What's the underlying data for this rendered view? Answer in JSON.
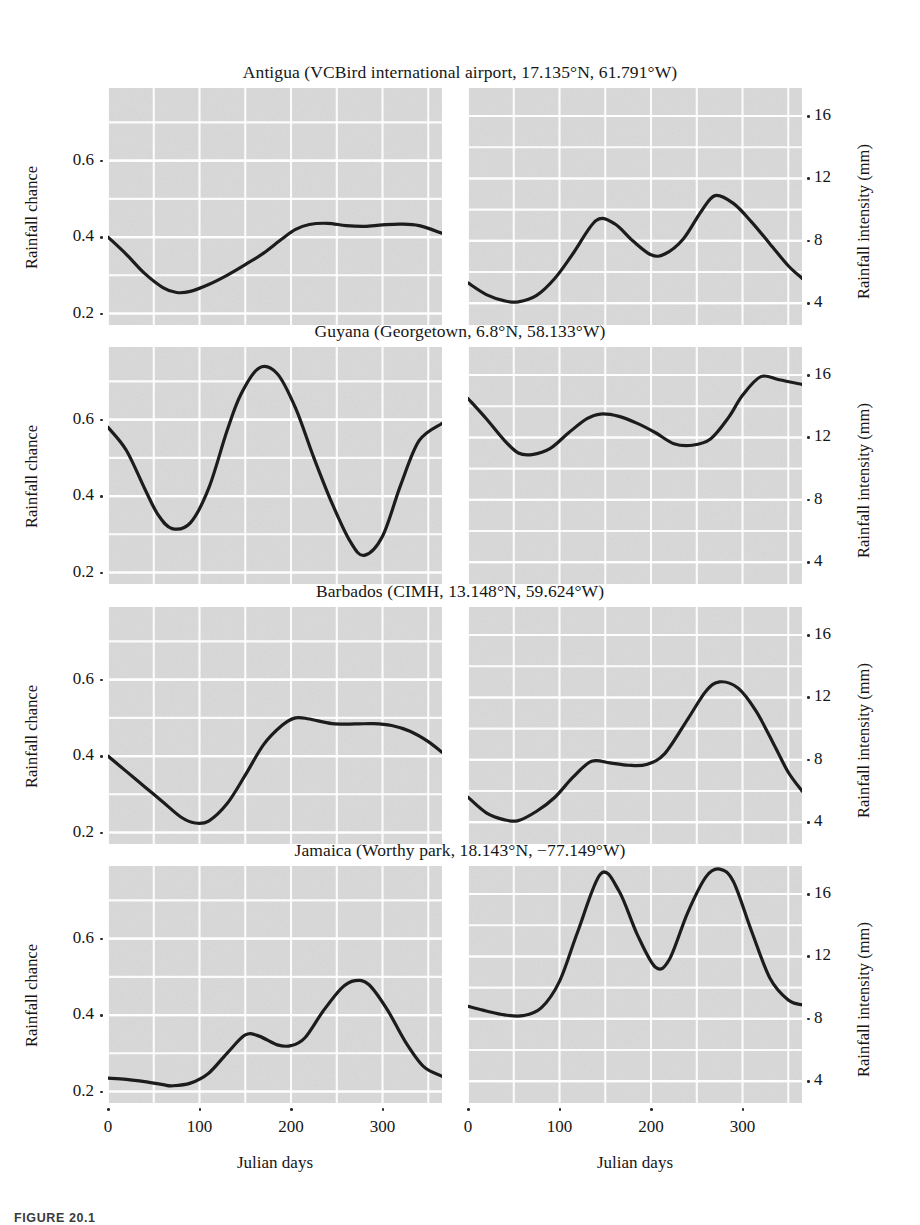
{
  "figure": {
    "caption": "FIGURE 20.1",
    "xlabel": "Julian days",
    "ylabel_left": "Rainfall chance",
    "ylabel_right": "Rainfall intensity (mm)",
    "xticks": [
      "0",
      "100",
      "200",
      "300"
    ],
    "xtick_values": [
      0,
      100,
      200,
      300
    ],
    "chance_yticks": [
      "0.2",
      "0.4",
      "0.6"
    ],
    "chance_ytick_values": [
      0.2,
      0.4,
      0.6
    ],
    "intensity_yticks": [
      "4",
      "8",
      "12",
      "16"
    ],
    "intensity_ytick_values": [
      4,
      8,
      12,
      16
    ],
    "curve_color": "#1c1c1c",
    "panel_bg_color": "#d9d9d9",
    "grid_color": "#ffffff",
    "titles": [
      "Antigua (VCBird international airport, 17.135°N, 61.791°W)",
      "Guyana (Georgetown, 6.8°N, 58.133°W)",
      "Barbados (CIMH, 13.148°N, 59.624°W)",
      "Jamaica (Worthy park, 18.143°N, −77.149°W)"
    ]
  },
  "chart_data": {
    "type": "line",
    "xlabel": "Julian days",
    "grid": true,
    "legend": "none",
    "xlim": [
      0,
      365
    ],
    "panels": [
      {
        "station": "Antigua",
        "title": "Antigua (VCBird international airport, 17.135°N, 61.791°W)",
        "left": {
          "ylabel": "Rainfall chance",
          "ylim": [
            0.17,
            0.79
          ],
          "yticks": [
            0.2,
            0.4,
            0.6
          ],
          "x": [
            0,
            20,
            40,
            60,
            75,
            90,
            110,
            130,
            150,
            170,
            190,
            205,
            220,
            240,
            260,
            280,
            300,
            320,
            340,
            365
          ],
          "y": [
            0.4,
            0.355,
            0.305,
            0.268,
            0.255,
            0.258,
            0.276,
            0.3,
            0.328,
            0.358,
            0.395,
            0.42,
            0.433,
            0.436,
            0.43,
            0.428,
            0.432,
            0.434,
            0.43,
            0.41
          ]
        },
        "right": {
          "ylabel": "Rainfall intensity (mm)",
          "ylim": [
            2.6,
            17.8
          ],
          "yticks": [
            4,
            8,
            12,
            16
          ],
          "x": [
            0,
            20,
            40,
            55,
            75,
            95,
            115,
            140,
            160,
            180,
            200,
            215,
            235,
            255,
            270,
            290,
            310,
            330,
            350,
            365
          ],
          "y": [
            5.3,
            4.55,
            4.15,
            4.08,
            4.5,
            5.6,
            7.2,
            9.3,
            9.1,
            8.0,
            7.1,
            7.15,
            8.1,
            9.9,
            10.9,
            10.4,
            9.2,
            7.8,
            6.4,
            5.6
          ]
        }
      },
      {
        "station": "Guyana",
        "title": "Guyana (Georgetown, 6.8°N, 58.133°W)",
        "left": {
          "ylabel": "Rainfall chance",
          "ylim": [
            0.17,
            0.79
          ],
          "yticks": [
            0.2,
            0.4,
            0.6
          ],
          "x": [
            0,
            20,
            40,
            55,
            70,
            90,
            110,
            130,
            145,
            165,
            185,
            205,
            225,
            245,
            265,
            280,
            300,
            320,
            340,
            365
          ],
          "y": [
            0.58,
            0.52,
            0.42,
            0.35,
            0.315,
            0.33,
            0.42,
            0.57,
            0.665,
            0.735,
            0.72,
            0.63,
            0.5,
            0.38,
            0.28,
            0.245,
            0.295,
            0.43,
            0.545,
            0.59
          ]
        },
        "right": {
          "ylabel": "Rainfall intensity (mm)",
          "ylim": [
            2.6,
            17.8
          ],
          "yticks": [
            4,
            8,
            12,
            16
          ],
          "x": [
            0,
            20,
            40,
            55,
            70,
            90,
            110,
            130,
            145,
            165,
            185,
            205,
            225,
            245,
            265,
            285,
            300,
            320,
            340,
            365
          ],
          "y": [
            14.5,
            13.2,
            11.8,
            11.0,
            10.9,
            11.3,
            12.3,
            13.2,
            13.5,
            13.35,
            12.9,
            12.3,
            11.6,
            11.5,
            11.9,
            13.3,
            14.7,
            15.9,
            15.7,
            15.4
          ]
        }
      },
      {
        "station": "Barbados",
        "title": "Barbados (CIMH, 13.148°N, 59.624°W)",
        "left": {
          "ylabel": "Rainfall chance",
          "ylim": [
            0.17,
            0.79
          ],
          "yticks": [
            0.2,
            0.4,
            0.6
          ],
          "x": [
            0,
            20,
            40,
            60,
            80,
            95,
            110,
            130,
            150,
            170,
            190,
            205,
            220,
            245,
            270,
            290,
            310,
            330,
            350,
            365
          ],
          "y": [
            0.4,
            0.36,
            0.32,
            0.28,
            0.24,
            0.225,
            0.23,
            0.275,
            0.35,
            0.43,
            0.48,
            0.5,
            0.497,
            0.485,
            0.484,
            0.485,
            0.48,
            0.465,
            0.438,
            0.41
          ]
        },
        "right": {
          "ylabel": "Rainfall intensity (mm)",
          "ylim": [
            2.6,
            17.8
          ],
          "yticks": [
            4,
            8,
            12,
            16
          ],
          "x": [
            0,
            20,
            40,
            55,
            75,
            95,
            115,
            135,
            155,
            175,
            195,
            215,
            240,
            260,
            275,
            295,
            315,
            335,
            350,
            365
          ],
          "y": [
            5.6,
            4.6,
            4.15,
            4.1,
            4.7,
            5.6,
            6.9,
            7.9,
            7.8,
            7.65,
            7.7,
            8.4,
            10.6,
            12.4,
            13.0,
            12.6,
            11.1,
            8.9,
            7.2,
            6.0
          ]
        }
      },
      {
        "station": "Jamaica",
        "title": "Jamaica (Worthy park, 18.143°N, −77.149°W)",
        "left": {
          "ylabel": "Rainfall chance",
          "ylim": [
            0.17,
            0.79
          ],
          "yticks": [
            0.2,
            0.4,
            0.6
          ],
          "x": [
            0,
            20,
            40,
            60,
            70,
            90,
            110,
            130,
            150,
            165,
            185,
            200,
            215,
            235,
            255,
            270,
            285,
            305,
            325,
            345,
            365
          ],
          "y": [
            0.235,
            0.232,
            0.226,
            0.218,
            0.215,
            0.222,
            0.248,
            0.3,
            0.348,
            0.345,
            0.322,
            0.32,
            0.34,
            0.41,
            0.47,
            0.49,
            0.48,
            0.415,
            0.33,
            0.265,
            0.24
          ]
        },
        "right": {
          "ylabel": "Rainfall intensity (mm)",
          "ylim": [
            2.6,
            17.8
          ],
          "yticks": [
            4,
            8,
            12,
            16
          ],
          "x": [
            0,
            20,
            40,
            60,
            80,
            100,
            120,
            145,
            165,
            185,
            205,
            220,
            240,
            260,
            275,
            290,
            310,
            330,
            350,
            365
          ],
          "y": [
            8.8,
            8.5,
            8.25,
            8.2,
            8.7,
            10.4,
            13.6,
            17.3,
            16.2,
            13.4,
            11.3,
            11.8,
            14.8,
            17.1,
            17.6,
            16.8,
            13.6,
            10.6,
            9.2,
            8.9
          ]
        }
      }
    ]
  }
}
